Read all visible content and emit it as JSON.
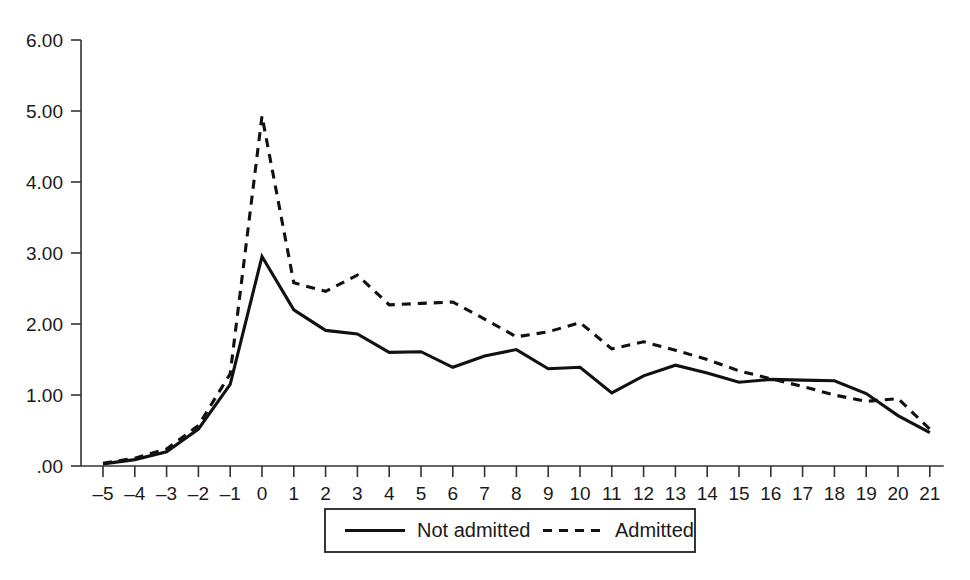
{
  "chart_data": {
    "type": "line",
    "title": "",
    "subtitle": "",
    "xlabel": "",
    "ylabel": "",
    "x": [
      -5,
      -4,
      -3,
      -2,
      -1,
      0,
      1,
      2,
      3,
      4,
      5,
      6,
      7,
      8,
      9,
      10,
      11,
      12,
      13,
      14,
      15,
      16,
      17,
      18,
      19,
      20,
      21
    ],
    "xticklabels": [
      "–5",
      "–4",
      "–3",
      "–2",
      "–1",
      "0",
      "1",
      "2",
      "3",
      "4",
      "5",
      "6",
      "7",
      "8",
      "9",
      "10",
      "11",
      "12",
      "13",
      "14",
      "15",
      "16",
      "17",
      "18",
      "19",
      "20",
      "21"
    ],
    "yticks": [
      0,
      1,
      2,
      3,
      4,
      5,
      6
    ],
    "yticklabels": [
      ".00",
      "1.00",
      "2.00",
      "3.00",
      "4.00",
      "5.00",
      "6.00"
    ],
    "xlim": [
      -5,
      21
    ],
    "ylim": [
      0,
      6
    ],
    "grid": false,
    "legend_position": "bottom-center",
    "series": [
      {
        "name": "Not admitted",
        "style": "solid",
        "color": "#111111",
        "values": [
          0.03,
          0.09,
          0.2,
          0.52,
          1.15,
          2.95,
          2.2,
          1.91,
          1.86,
          1.6,
          1.61,
          1.39,
          1.55,
          1.64,
          1.37,
          1.39,
          1.03,
          1.27,
          1.42,
          1.31,
          1.18,
          1.22,
          1.21,
          1.2,
          1.02,
          0.71,
          0.47
        ]
      },
      {
        "name": "Admitted",
        "style": "dashed",
        "color": "#111111",
        "values": [
          0.04,
          0.11,
          0.24,
          0.57,
          1.3,
          4.93,
          2.58,
          2.46,
          2.69,
          2.27,
          2.29,
          2.31,
          2.07,
          1.82,
          1.89,
          2.02,
          1.65,
          1.75,
          1.63,
          1.5,
          1.34,
          1.23,
          1.12,
          1.0,
          0.91,
          0.95,
          0.52
        ]
      }
    ]
  },
  "legend": {
    "items": [
      {
        "label": "Not admitted",
        "style": "solid"
      },
      {
        "label": "Admitted",
        "style": "dashed"
      }
    ]
  }
}
